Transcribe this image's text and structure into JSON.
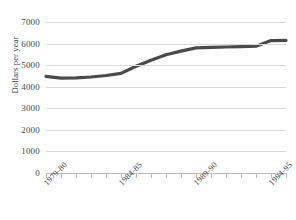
{
  "chart_data": {
    "type": "line",
    "title": "",
    "xlabel": "",
    "ylabel": "Dollars per year",
    "ylim": [
      0,
      7000
    ],
    "ytick_labels": [
      "7000",
      "6000",
      "5000",
      "4000",
      "3000",
      "2000",
      "1000",
      "0"
    ],
    "ytick_values": [
      7000,
      6000,
      5000,
      4000,
      3000,
      2000,
      1000,
      0
    ],
    "grid": true,
    "legend": null,
    "x": [
      "1979-80",
      "1980-81",
      "1981-82",
      "1982-83",
      "1983-84",
      "1984-85",
      "1985-86",
      "1986-87",
      "1987-88",
      "1988-89",
      "1989-90",
      "1990-91",
      "1991-92",
      "1992-93",
      "1993-94",
      "1994-95",
      "1995-96"
    ],
    "xtick_labels_shown": [
      "1979-80",
      "1984-85",
      "1989-90",
      "1994-95"
    ],
    "xtick_label_indices": [
      0,
      5,
      10,
      15
    ],
    "values": [
      4480,
      4400,
      4410,
      4450,
      4520,
      4620,
      4950,
      5230,
      5480,
      5650,
      5800,
      5820,
      5840,
      5860,
      5880,
      6140,
      6150
    ],
    "series_color": "#4a4a4a",
    "series_width": 3.2,
    "grid_color": "#d9d9d9",
    "axis_color": "#b9b9b9"
  },
  "figure": {
    "cut_off_top_text": "",
    "background_color": "#ffffff"
  }
}
